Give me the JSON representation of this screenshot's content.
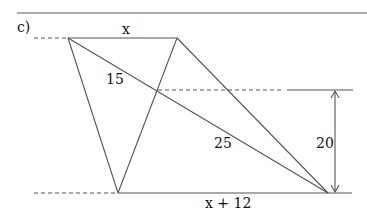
{
  "figure": {
    "part_label": "c)",
    "labels": {
      "top_side": "x",
      "bottom_side": "x + 12",
      "upper_diagonal_segment": "15",
      "lower_diagonal_segment": "25",
      "height": "20"
    },
    "colors": {
      "line": "#555555",
      "text": "#111111",
      "background": "#ffffff"
    }
  }
}
